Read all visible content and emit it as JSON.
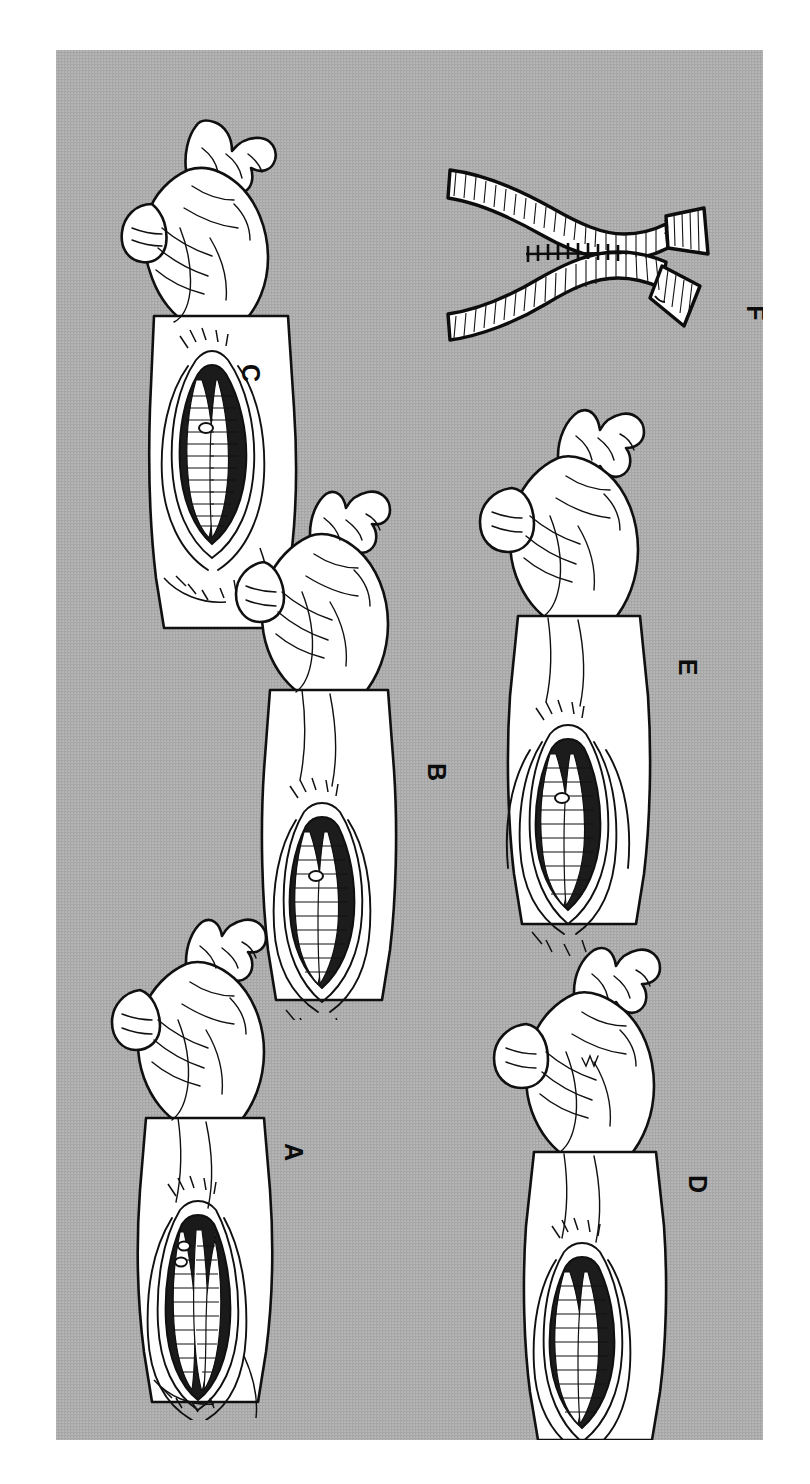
{
  "figure": {
    "orientation": "rotated-90-clockwise",
    "background_color": "#a9a9a9",
    "ink_color": "#0c0c0c",
    "skin_color": "#ffffff",
    "plate": {
      "x": 56,
      "y": 50,
      "width": 707,
      "height": 1390
    }
  },
  "panels": [
    {
      "id": "A",
      "label": "A",
      "label_x": 254,
      "label_y": 1092,
      "subject": "hand-and-forearm-with-open-volar-incision",
      "description": "Hand in semi-flexed posture with forearm wound open showing parallel tendons and muscle bellies"
    },
    {
      "id": "B",
      "label": "B",
      "label_x": 379,
      "label_y": 722,
      "subject": "hand-and-forearm-with-open-volar-incision",
      "description": "Hand with extended fingers and forearm wound exposing tendon group"
    },
    {
      "id": "C",
      "label": "C",
      "label_x": 250,
      "label_y": 373,
      "subject": "hand-and-forearm-with-open-volar-incision",
      "description": "Hand with thumb abducted and forearm wound exposing dissected tendons"
    },
    {
      "id": "D",
      "label": "D",
      "label_x": 686,
      "label_y": 1134,
      "subject": "hand-and-forearm-with-open-volar-incision",
      "description": "Hand with forearm wound showing sutured tendon repair"
    },
    {
      "id": "E",
      "label": "E",
      "label_x": 618,
      "label_y": 617,
      "subject": "hand-and-forearm-with-open-volar-incision",
      "description": "Hand with forearm wound showing completed tendon anastomosis"
    },
    {
      "id": "F",
      "label": "F",
      "label_x": 700,
      "label_y": 266,
      "subject": "tendon-side-to-side-anastomosis-detail",
      "description": "Close-up of two tendons joined side to side by interrupted sutures"
    }
  ]
}
